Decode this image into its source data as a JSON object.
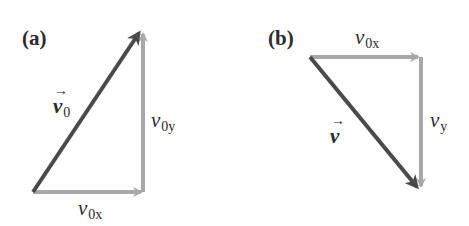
{
  "panels": [
    {
      "id": "a",
      "label": "(a)",
      "vectors": {
        "resultant": {
          "symbol": "v",
          "subscript": "0",
          "arrow": "→",
          "color": "#4a4a4a",
          "from": [
            33,
            192
          ],
          "to": [
            141,
            30
          ]
        },
        "x_component": {
          "symbol": "v",
          "subscript": "0x",
          "color": "#a8a8a8",
          "from": [
            33,
            192
          ],
          "to": [
            143,
            192
          ]
        },
        "y_component": {
          "symbol": "v",
          "subscript": "0y",
          "color": "#a8a8a8",
          "from": [
            143,
            192
          ],
          "to": [
            143,
            30
          ]
        }
      }
    },
    {
      "id": "b",
      "label": "(b)",
      "vectors": {
        "resultant": {
          "symbol": "v",
          "subscript": "",
          "arrow": "→",
          "color": "#4a4a4a",
          "from": [
            310,
            57
          ],
          "to": [
            420,
            190
          ]
        },
        "x_component": {
          "symbol": "v",
          "subscript": "0x",
          "color": "#a8a8a8",
          "from": [
            310,
            57
          ],
          "to": [
            420,
            57
          ]
        },
        "y_component": {
          "symbol": "v",
          "subscript": "y",
          "color": "#a8a8a8",
          "from": [
            420,
            57
          ],
          "to": [
            420,
            190
          ]
        }
      }
    }
  ]
}
